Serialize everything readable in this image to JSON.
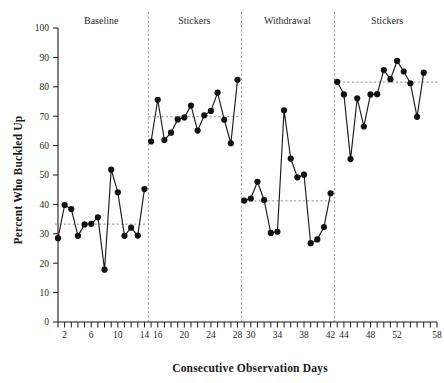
{
  "chart_data": {
    "type": "line",
    "title": "",
    "xlabel": "Consecutive Observation Days",
    "ylabel": "Percent Who Buckled Up",
    "xlim": [
      1,
      58
    ],
    "ylim": [
      0,
      100
    ],
    "grid": false,
    "legend_position": "none",
    "y_ticks": [
      0,
      10,
      20,
      30,
      40,
      50,
      60,
      70,
      80,
      90,
      100
    ],
    "y_tick_labels": [
      "0",
      "10",
      "20",
      "30",
      "40",
      "50",
      "60",
      "70",
      "80",
      "90",
      "100"
    ],
    "x_ticks": [
      2,
      6,
      10,
      14,
      16,
      20,
      24,
      28,
      30,
      34,
      38,
      42,
      44,
      48,
      52,
      58
    ],
    "x_tick_labels": [
      "2",
      "6",
      "10",
      "14",
      "16",
      "20",
      "24",
      "28",
      "30",
      "34",
      "38",
      "42",
      "44",
      "48",
      "52",
      "58"
    ],
    "x_minor_tick_step": 1,
    "marker": "filled-circle",
    "marker_color": "#121212",
    "line_color": "#1a1a1a",
    "phase_labels": [
      "Baseline",
      "Stickers",
      "Withdrawal",
      "Stickers"
    ],
    "phase_divider_x": [
      14.6,
      28.6,
      42.6
    ],
    "phases": [
      {
        "name": "Baseline",
        "label": "Baseline",
        "x_start": 1,
        "x_end": 14,
        "mean": 33.3,
        "x": [
          1,
          2,
          3,
          4,
          5,
          6,
          7,
          8,
          9,
          10,
          11,
          12,
          13,
          14
        ],
        "y": [
          28.5,
          39.8,
          38.4,
          29.3,
          33.2,
          33.4,
          35.6,
          17.8,
          51.8,
          44.1,
          29.3,
          32.1,
          29.4,
          45.2
        ]
      },
      {
        "name": "Stickers",
        "label": "Stickers",
        "x_start": 15,
        "x_end": 28,
        "mean": 69.8,
        "x": [
          15,
          16,
          17,
          18,
          19,
          20,
          21,
          22,
          23,
          24,
          25,
          26,
          27,
          28
        ],
        "y": [
          61.4,
          75.6,
          61.9,
          64.4,
          68.9,
          69.6,
          73.6,
          65.1,
          70.3,
          71.8,
          78.0,
          68.8,
          60.8,
          82.4
        ]
      },
      {
        "name": "Withdrawal",
        "label": "Withdrawal",
        "x_start": 29,
        "x_end": 42,
        "mean": 41.2,
        "x": [
          29,
          30,
          31,
          32,
          33,
          34,
          35,
          36,
          37,
          38,
          39,
          40,
          41,
          42
        ],
        "y": [
          41.3,
          42.0,
          47.7,
          41.5,
          30.3,
          30.7,
          72.0,
          55.6,
          49.2,
          50.1,
          26.8,
          28.1,
          32.3,
          43.8
        ]
      },
      {
        "name": "Stickers",
        "label": "Stickers",
        "x_start": 43,
        "x_end": 58,
        "mean": 81.6,
        "x": [
          43,
          44,
          45,
          46,
          47,
          48,
          49,
          50,
          51,
          52,
          53,
          54,
          55,
          56
        ],
        "y": [
          81.7,
          77.4,
          55.4,
          76.1,
          66.5,
          77.4,
          77.5,
          85.7,
          82.6,
          88.8,
          85.2,
          81.2,
          69.8,
          84.8
        ]
      }
    ]
  },
  "axes": {
    "y_axis_title": "Percent Who Buckled Up",
    "x_axis_title": "Consecutive Observation Days"
  }
}
